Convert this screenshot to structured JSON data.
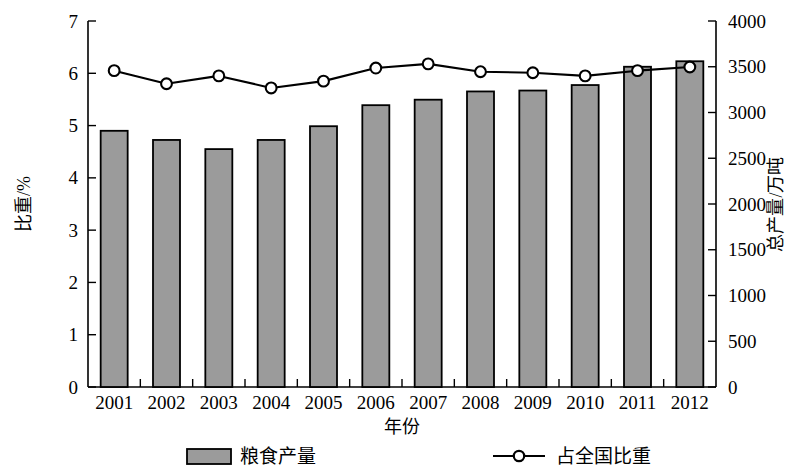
{
  "chart_data": {
    "type": "bar",
    "title": "",
    "subtitle": "",
    "xlabel": "年份",
    "ylabel": "比重/%",
    "y2label": "总产量/万吨",
    "categories": [
      "2001",
      "2002",
      "2003",
      "2004",
      "2005",
      "2006",
      "2007",
      "2008",
      "2009",
      "2010",
      "2011",
      "2012"
    ],
    "ylim": [
      0,
      7
    ],
    "y2lim": [
      0,
      4000
    ],
    "yticks": [
      "0",
      "1",
      "2",
      "3",
      "4",
      "5",
      "6",
      "7"
    ],
    "y2ticks": [
      "0",
      "500",
      "1000",
      "1500",
      "2000",
      "2500",
      "3000",
      "3500",
      "4000"
    ],
    "grid": false,
    "legend_position": "bottom",
    "series": [
      {
        "name": "粮食产量",
        "kind": "bar",
        "axis": "right",
        "unit": "万吨",
        "color": "#9b9b9b",
        "edge_color": "#000000",
        "values": [
          2800,
          2700,
          2600,
          2700,
          2850,
          3080,
          3140,
          3230,
          3240,
          3300,
          3500,
          3560
        ]
      },
      {
        "name": "占全国比重",
        "kind": "line",
        "axis": "left",
        "unit": "%",
        "color": "#000000",
        "marker": "circle-open",
        "values": [
          6.05,
          5.8,
          5.95,
          5.72,
          5.85,
          6.1,
          6.18,
          6.03,
          6.01,
          5.95,
          6.05,
          6.12
        ]
      }
    ]
  },
  "legend": {
    "items": [
      {
        "label": "粮食产量",
        "swatch": "bar-swatch"
      },
      {
        "label": "占全国比重",
        "swatch": "line-marker-swatch"
      }
    ]
  },
  "axes": {
    "left_title": "比重/%",
    "right_title": "总产量/万吨",
    "bottom_title": "年份"
  }
}
